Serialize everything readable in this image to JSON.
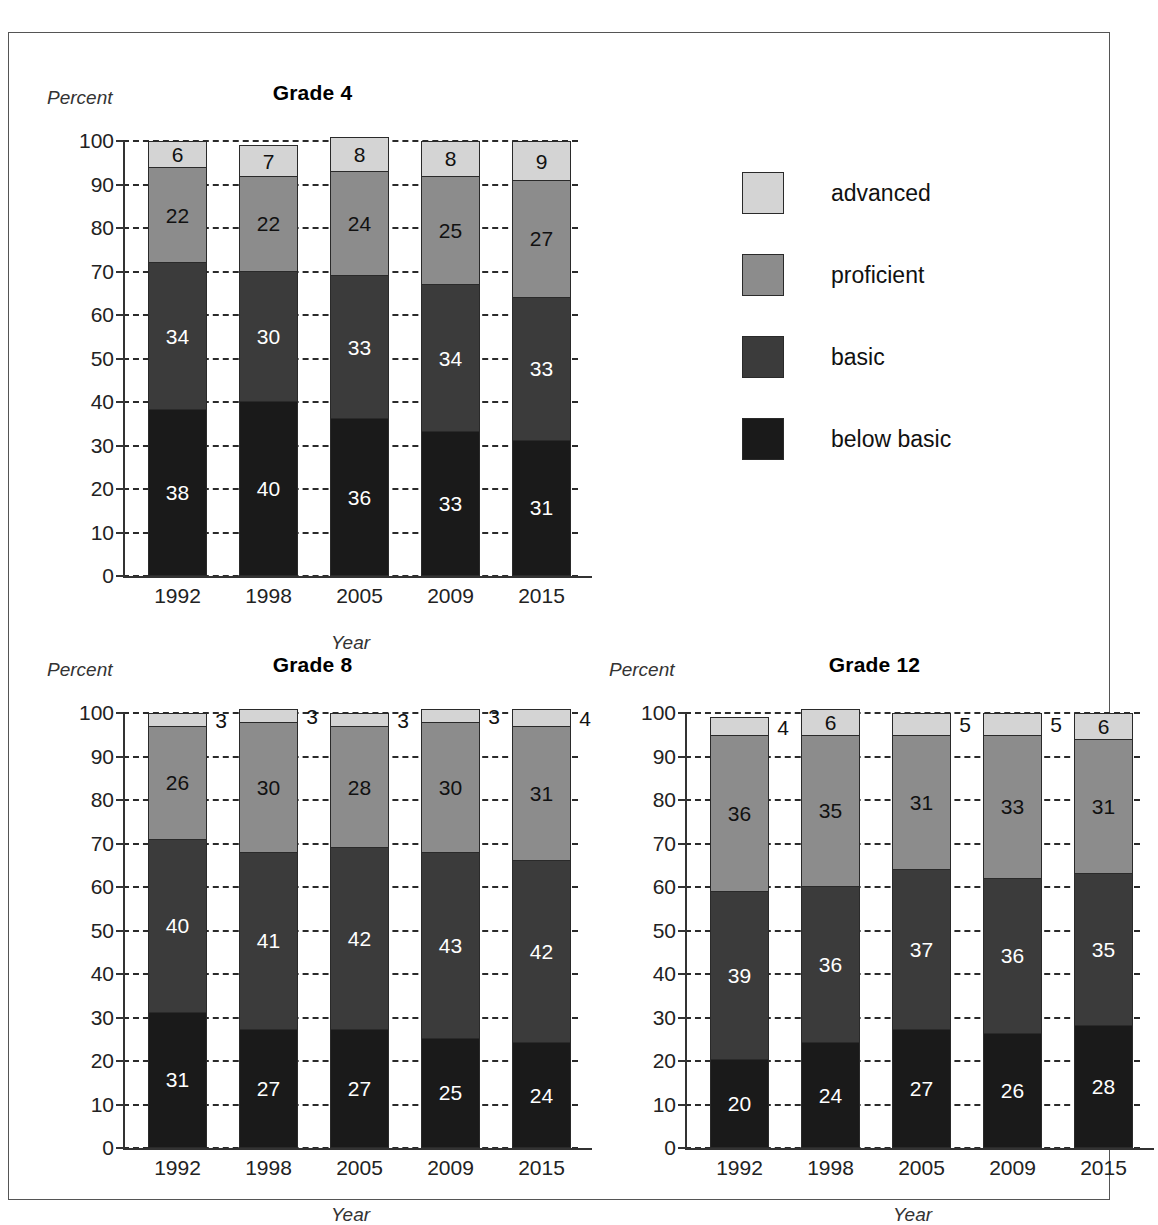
{
  "legend": {
    "items": [
      {
        "label": "advanced",
        "color": "#d4d4d4"
      },
      {
        "label": "proficient",
        "color": "#8c8c8c"
      },
      {
        "label": "basic",
        "color": "#3b3b3b"
      },
      {
        "label": "below basic",
        "color": "#1a1a1a"
      }
    ]
  },
  "axis": {
    "ylabel": "Percent",
    "xlabel": "Year",
    "yticks": [
      0,
      10,
      20,
      30,
      40,
      50,
      60,
      70,
      80,
      90,
      100
    ]
  },
  "chart_data": [
    {
      "type": "bar",
      "id": "grade-4",
      "title": "Grade 4",
      "xlabel": "Year",
      "ylabel": "Percent",
      "ylim": [
        0,
        100
      ],
      "grid": true,
      "stacked": true,
      "legend_position": "outside-right",
      "categories": [
        "1992",
        "1998",
        "2005",
        "2009",
        "2015"
      ],
      "series": [
        {
          "name": "below basic",
          "color": "#1a1a1a",
          "text": "#ffffff",
          "values": [
            38,
            40,
            36,
            33,
            31
          ],
          "label_outside": [
            false,
            false,
            false,
            false,
            false
          ]
        },
        {
          "name": "basic",
          "color": "#3b3b3b",
          "text": "#ffffff",
          "values": [
            34,
            30,
            33,
            34,
            33
          ],
          "label_outside": [
            false,
            false,
            false,
            false,
            false
          ]
        },
        {
          "name": "proficient",
          "color": "#8c8c8c",
          "text": "#111111",
          "values": [
            22,
            22,
            24,
            25,
            27
          ],
          "label_outside": [
            false,
            false,
            false,
            false,
            false
          ]
        },
        {
          "name": "advanced",
          "color": "#d4d4d4",
          "text": "#111111",
          "values": [
            6,
            7,
            8,
            8,
            9
          ],
          "label_outside": [
            false,
            false,
            false,
            false,
            false
          ]
        }
      ]
    },
    {
      "type": "bar",
      "id": "grade-8",
      "title": "Grade 8",
      "xlabel": "Year",
      "ylabel": "Percent",
      "ylim": [
        0,
        100
      ],
      "grid": true,
      "stacked": true,
      "categories": [
        "1992",
        "1998",
        "2005",
        "2009",
        "2015"
      ],
      "series": [
        {
          "name": "below basic",
          "color": "#1a1a1a",
          "text": "#ffffff",
          "values": [
            31,
            27,
            27,
            25,
            24
          ],
          "label_outside": [
            false,
            false,
            false,
            false,
            false
          ]
        },
        {
          "name": "basic",
          "color": "#3b3b3b",
          "text": "#ffffff",
          "values": [
            40,
            41,
            42,
            43,
            42
          ],
          "label_outside": [
            false,
            false,
            false,
            false,
            false
          ]
        },
        {
          "name": "proficient",
          "color": "#8c8c8c",
          "text": "#111111",
          "values": [
            26,
            30,
            28,
            30,
            31
          ],
          "label_outside": [
            false,
            false,
            false,
            false,
            false
          ]
        },
        {
          "name": "advanced",
          "color": "#d4d4d4",
          "text": "#111111",
          "values": [
            3,
            3,
            3,
            3,
            4
          ],
          "label_outside": [
            true,
            true,
            true,
            true,
            true
          ]
        }
      ]
    },
    {
      "type": "bar",
      "id": "grade-12",
      "title": "Grade 12",
      "xlabel": "Year",
      "ylabel": "Percent",
      "ylim": [
        0,
        100
      ],
      "grid": true,
      "stacked": true,
      "categories": [
        "1992",
        "1998",
        "2005",
        "2009",
        "2015"
      ],
      "series": [
        {
          "name": "below basic",
          "color": "#1a1a1a",
          "text": "#ffffff",
          "values": [
            20,
            24,
            27,
            26,
            28
          ],
          "label_outside": [
            false,
            false,
            false,
            false,
            false
          ]
        },
        {
          "name": "basic",
          "color": "#3b3b3b",
          "text": "#ffffff",
          "values": [
            39,
            36,
            37,
            36,
            35
          ],
          "label_outside": [
            false,
            false,
            false,
            false,
            false
          ]
        },
        {
          "name": "proficient",
          "color": "#8c8c8c",
          "text": "#111111",
          "values": [
            36,
            35,
            31,
            33,
            31
          ],
          "label_outside": [
            false,
            false,
            false,
            false,
            false
          ]
        },
        {
          "name": "advanced",
          "color": "#d4d4d4",
          "text": "#111111",
          "values": [
            4,
            6,
            5,
            5,
            6
          ],
          "label_outside": [
            true,
            false,
            true,
            true,
            false
          ]
        }
      ]
    }
  ],
  "layout": {
    "charts": [
      {
        "id": "grade-4",
        "left": 38,
        "top": 48,
        "plot_left": 76,
        "plot_top": 60,
        "plot_w": 455,
        "plot_h": 435
      },
      {
        "id": "grade-8",
        "left": 38,
        "top": 620,
        "plot_left": 76,
        "plot_top": 60,
        "plot_w": 455,
        "plot_h": 435
      },
      {
        "id": "grade-12",
        "left": 600,
        "top": 620,
        "plot_left": 76,
        "plot_top": 60,
        "plot_w": 455,
        "plot_h": 435
      }
    ]
  }
}
